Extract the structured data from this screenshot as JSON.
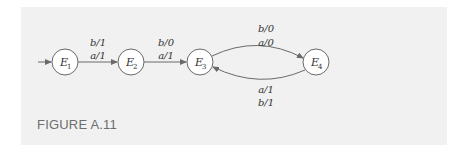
{
  "figure": {
    "caption": "FIGURE A.11",
    "colors": {
      "background": "#f1f1f1",
      "node_fill": "#ffffff",
      "stroke": "#6a6a6a",
      "text": "#333333",
      "caption": "#6e6e6e"
    }
  },
  "diagram": {
    "type": "state-machine",
    "start_state": "E1",
    "nodes": [
      {
        "id": "E1",
        "label": "E",
        "sub": "1"
      },
      {
        "id": "E2",
        "label": "E",
        "sub": "2"
      },
      {
        "id": "E3",
        "label": "E",
        "sub": "3"
      },
      {
        "id": "E4",
        "label": "E",
        "sub": "4"
      }
    ],
    "edges": [
      {
        "from": "E1",
        "to": "E2",
        "labels": [
          "b/1",
          "a/1"
        ]
      },
      {
        "from": "E2",
        "to": "E3",
        "labels": [
          "b/0",
          "a/1"
        ]
      },
      {
        "from": "E3",
        "to": "E4",
        "labels": [
          "b/0",
          "a/0"
        ]
      },
      {
        "from": "E4",
        "to": "E3",
        "labels": [
          "a/1",
          "b/1"
        ]
      }
    ]
  }
}
